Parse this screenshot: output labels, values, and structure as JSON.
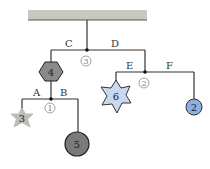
{
  "diagram": {
    "type": "hanging mobile",
    "ceiling": {
      "color": "#c8c8c0"
    },
    "rods": [
      {
        "id": "rod-3",
        "label": "3",
        "left_segment": "C",
        "right_segment": "D"
      },
      {
        "id": "rod-2",
        "label": "2",
        "left_segment": "E",
        "right_segment": "F"
      },
      {
        "id": "rod-1",
        "label": "1",
        "left_segment": "A",
        "right_segment": "B"
      }
    ],
    "objects": [
      {
        "id": "hexagon",
        "label": "4",
        "shape": "hexagon",
        "color": "#8a8a8a"
      },
      {
        "id": "star-6",
        "label": "6",
        "shape": "7-point star",
        "color": "#c9d8ee"
      },
      {
        "id": "circle-2",
        "label": "2",
        "shape": "circle",
        "color": "#8eaee0"
      },
      {
        "id": "star-3",
        "label": "3",
        "shape": "5-point star",
        "color": "#bdbdb5"
      },
      {
        "id": "circle-5",
        "label": "5",
        "shape": "circle",
        "color": "#7a7a7a"
      }
    ]
  }
}
